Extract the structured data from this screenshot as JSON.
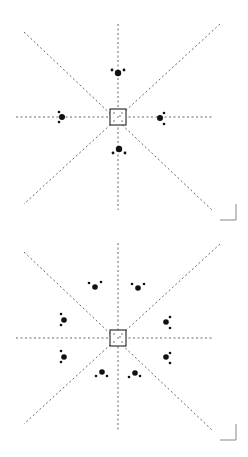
{
  "figure": {
    "colors": {
      "background": "#ffffff",
      "line": "#555555",
      "dot": "#111111",
      "box": "#222222",
      "bracket": "#888888"
    },
    "panels": [
      {
        "id": "panel-4-cluster",
        "offset_y": 0,
        "center": [
          118,
          117
        ],
        "box_size": 16,
        "lines": [
          {
            "x1": 118,
            "y1": 24,
            "x2": 118,
            "y2": 210
          },
          {
            "x1": 16,
            "y1": 117,
            "x2": 212,
            "y2": 117
          },
          {
            "x1": 24,
            "y1": 32,
            "x2": 212,
            "y2": 210
          },
          {
            "x1": 220,
            "y1": 24,
            "x2": 24,
            "y2": 204
          }
        ],
        "clusters": [
          {
            "name": "top",
            "dots": [
              [
                118,
                73,
                3.2
              ],
              [
                112,
                70,
                1.4
              ],
              [
                124,
                70,
                1.4
              ]
            ]
          },
          {
            "name": "left",
            "dots": [
              [
                62,
                117,
                3.0
              ],
              [
                59,
                112,
                1.3
              ],
              [
                59,
                122,
                1.3
              ]
            ]
          },
          {
            "name": "right",
            "dots": [
              [
                160,
                118,
                3.0
              ],
              [
                164,
                113,
                1.3
              ],
              [
                164,
                124,
                1.3
              ]
            ]
          },
          {
            "name": "bottom",
            "dots": [
              [
                119,
                149,
                3.2
              ],
              [
                113,
                153,
                1.4
              ],
              [
                125,
                153,
                1.4
              ]
            ]
          }
        ],
        "bracket": {
          "x": 220,
          "y": 204,
          "size": 16
        }
      },
      {
        "id": "panel-8-cluster",
        "offset_y": 0,
        "center": [
          118,
          338
        ],
        "box_size": 16,
        "lines": [
          {
            "x1": 118,
            "y1": 243,
            "x2": 118,
            "y2": 430
          },
          {
            "x1": 16,
            "y1": 338,
            "x2": 212,
            "y2": 338
          },
          {
            "x1": 24,
            "y1": 252,
            "x2": 212,
            "y2": 430
          },
          {
            "x1": 220,
            "y1": 244,
            "x2": 24,
            "y2": 424
          }
        ],
        "clusters": [
          {
            "name": "upper-left",
            "dots": [
              [
                95,
                287,
                2.8
              ],
              [
                89,
                283,
                1.3
              ],
              [
                101,
                282,
                1.3
              ]
            ]
          },
          {
            "name": "upper-right",
            "dots": [
              [
                138,
                288,
                2.8
              ],
              [
                132,
                284,
                1.3
              ],
              [
                144,
                284,
                1.3
              ]
            ]
          },
          {
            "name": "mid-upper-left",
            "dots": [
              [
                64,
                320,
                2.8
              ],
              [
                61,
                314,
                1.3
              ],
              [
                61,
                325,
                1.3
              ]
            ]
          },
          {
            "name": "mid-upper-right",
            "dots": [
              [
                166,
                322,
                2.8
              ],
              [
                170,
                317,
                1.3
              ],
              [
                170,
                328,
                1.3
              ]
            ]
          },
          {
            "name": "mid-lower-left",
            "dots": [
              [
                64,
                357,
                2.8
              ],
              [
                61,
                351,
                1.3
              ],
              [
                61,
                362,
                1.3
              ]
            ]
          },
          {
            "name": "mid-lower-right",
            "dots": [
              [
                166,
                357,
                2.8
              ],
              [
                170,
                353,
                1.3
              ],
              [
                170,
                363,
                1.3
              ]
            ]
          },
          {
            "name": "lower-left",
            "dots": [
              [
                102,
                372,
                2.8
              ],
              [
                96,
                376,
                1.3
              ],
              [
                107,
                376,
                1.3
              ]
            ]
          },
          {
            "name": "lower-right",
            "dots": [
              [
                135,
                373,
                2.8
              ],
              [
                129,
                377,
                1.3
              ],
              [
                140,
                376,
                1.3
              ]
            ]
          }
        ],
        "bracket": {
          "x": 220,
          "y": 424,
          "size": 16
        }
      }
    ]
  }
}
